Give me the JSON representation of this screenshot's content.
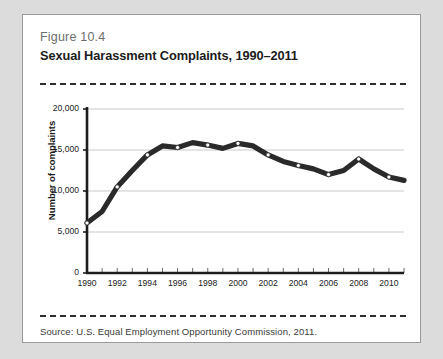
{
  "figure": {
    "number": "Figure 10.4",
    "title": "Sexual Harassment Complaints, 1990–2011",
    "source": "Source:  U.S. Equal Employment Opportunity Commission, 2011."
  },
  "colors": {
    "page_background": "#dcdcdc",
    "card_background": "#ffffff",
    "card_border": "#9a9a9a",
    "rule": "#2f2f2f",
    "line": "#2a2a2a",
    "marker_fill": "#ffffff",
    "gridline": "#c9c9c9",
    "axis": "#1c1c1c",
    "figure_number_text": "#6d6d6d",
    "title_text": "#1c1c1c"
  },
  "chart_data": {
    "type": "line",
    "title": "Sexual Harassment Complaints, 1990–2011",
    "xlabel": "",
    "ylabel": "Number of complaints",
    "xlim": [
      1990,
      2011
    ],
    "ylim": [
      0,
      20000
    ],
    "grid": true,
    "legend": "none",
    "ytick_labels": [
      "0",
      "5,000",
      "10,000",
      "15,000",
      "20,000"
    ],
    "ytick_values": [
      0,
      5000,
      10000,
      15000,
      20000
    ],
    "xtick_labels": [
      "1990",
      "1992",
      "1994",
      "1996",
      "1998",
      "2000",
      "2002",
      "2004",
      "2006",
      "2008",
      "2010"
    ],
    "xtick_values": [
      1990,
      1992,
      1994,
      1996,
      1998,
      2000,
      2002,
      2004,
      2006,
      2008,
      2010
    ],
    "x": [
      1990,
      1991,
      1992,
      1993,
      1994,
      1995,
      1996,
      1997,
      1998,
      1999,
      2000,
      2001,
      2002,
      2003,
      2004,
      2005,
      2006,
      2007,
      2008,
      2009,
      2010,
      2011
    ],
    "series": [
      {
        "name": "Number of complaints",
        "values": [
          6100,
          7500,
          10500,
          12500,
          14400,
          15500,
          15300,
          15900,
          15600,
          15200,
          15800,
          15500,
          14400,
          13600,
          13100,
          12700,
          12000,
          12500,
          13900,
          12700,
          11700,
          11300
        ]
      }
    ]
  }
}
